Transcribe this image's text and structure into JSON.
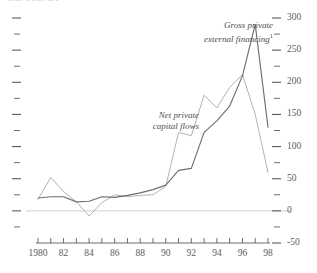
{
  "title": "IMF SURVEY",
  "chart_data": {
    "type": "line",
    "title": "",
    "xlabel": "",
    "ylabel": "",
    "x": [
      1980,
      1981,
      1982,
      1983,
      1984,
      1985,
      1986,
      1987,
      1988,
      1989,
      1990,
      1991,
      1992,
      1993,
      1994,
      1995,
      1996,
      1997,
      1998
    ],
    "xtick_labels": [
      "1980",
      "",
      "82",
      "",
      "84",
      "",
      "86",
      "",
      "88",
      "",
      "90",
      "",
      "92",
      "",
      "94",
      "",
      "96",
      "",
      "98"
    ],
    "ytick_labels": [
      "-50",
      "0",
      "50",
      "100",
      "150",
      "200",
      "250",
      "300"
    ],
    "ytick_values": [
      -50,
      0,
      50,
      100,
      150,
      200,
      250,
      300
    ],
    "yminor_values": [
      -25,
      25,
      75,
      125,
      175,
      225,
      275
    ],
    "ylim": [
      -50,
      300
    ],
    "xlim": [
      1980,
      1998
    ],
    "grid": false,
    "legend_position": "inline-annotations",
    "y_axis_side": "right",
    "zero_line": 0,
    "series": [
      {
        "name": "Gross private external financing",
        "footnote_marker": "1",
        "color": "#6e6e6e",
        "label_line1": "Gross private",
        "label_line2": "external financing",
        "values": [
          20,
          22,
          22,
          14,
          15,
          22,
          21,
          24,
          28,
          33,
          40,
          63,
          66,
          122,
          140,
          163,
          210,
          290,
          130
        ]
      },
      {
        "name": "Net private capital flows",
        "footnote_marker": "",
        "color": "#b3b3b3",
        "label_line1": "Net private",
        "label_line2": "capital flows",
        "values": [
          18,
          52,
          30,
          14,
          -8,
          13,
          25,
          22,
          24,
          25,
          38,
          122,
          117,
          180,
          160,
          192,
          212,
          150,
          60
        ]
      }
    ]
  },
  "annotations": {
    "gross": {
      "line1": "Gross private",
      "line2": "external financing",
      "superscript": "1"
    },
    "net": {
      "line1": "Net private",
      "line2": "capital flows"
    }
  },
  "colors": {
    "gross_line": "#6e6e6e",
    "net_line": "#b3b3b3",
    "axis": "#5c5c5c",
    "zero_line": "#d9d9d9",
    "text": "#5c5c5c"
  }
}
